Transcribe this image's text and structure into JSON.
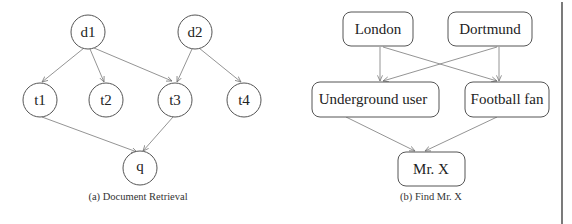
{
  "figure_a": {
    "caption": "(a)  Document Retrieval",
    "nodes": {
      "d1": "d1",
      "d2": "d2",
      "t1": "t1",
      "t2": "t2",
      "t3": "t3",
      "t4": "t4",
      "q": "q"
    },
    "edges": [
      [
        "d1",
        "t1"
      ],
      [
        "d1",
        "t2"
      ],
      [
        "d1",
        "t3"
      ],
      [
        "d2",
        "t3"
      ],
      [
        "d2",
        "t4"
      ],
      [
        "t1",
        "q"
      ],
      [
        "t3",
        "q"
      ]
    ]
  },
  "figure_b": {
    "caption": "(b)  Find Mr. X",
    "nodes": {
      "london": "London",
      "dortmund": "Dortmund",
      "underground_user": "Underground user",
      "football_fan": "Football fan",
      "mr_x": "Mr. X"
    },
    "edges": [
      [
        "London",
        "Underground user"
      ],
      [
        "London",
        "Football fan"
      ],
      [
        "Dortmund",
        "Underground user"
      ],
      [
        "Dortmund",
        "Football fan"
      ],
      [
        "Underground user",
        "Mr. X"
      ],
      [
        "Football fan",
        "Mr. X"
      ]
    ]
  },
  "colors": {
    "stroke": "#555555",
    "edge": "#777777",
    "text": "#222222",
    "divider": "#222222"
  }
}
